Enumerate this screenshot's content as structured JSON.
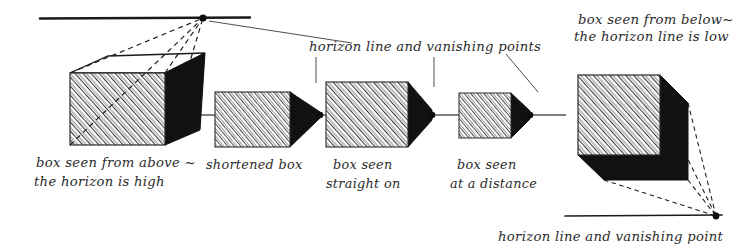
{
  "figure": {
    "background_color": "#ffffff",
    "ink_color": "#1a1a1a"
  },
  "annotations": {
    "top_center": {
      "text": "horizon line and vanishing points",
      "x": 310,
      "y": 48
    },
    "top_right": {
      "line1": "box seen from below~",
      "line2": "the horizon line is low",
      "x": 578,
      "y": 20
    },
    "bottom_right": {
      "text": "horizon line and vanishing point",
      "x": 498,
      "y": 238
    }
  },
  "captions": [
    {
      "id": "caption-box-above",
      "line1": "box seen from above ~",
      "line2": "the horizon is high",
      "x": 36,
      "y": 163
    },
    {
      "id": "caption-shortened-box",
      "line1": "shortened box",
      "line2": "",
      "x": 206,
      "y": 165
    },
    {
      "id": "caption-box-straight-on",
      "line1": "box seen",
      "line2": "straight on",
      "x": 330,
      "y": 165
    },
    {
      "id": "caption-box-at-distance",
      "line1": "box seen",
      "line2": "at a distance",
      "x": 452,
      "y": 165
    }
  ],
  "horizon_lines": [
    {
      "id": "horizon-top",
      "x1": 40,
      "y1": 18,
      "x2": 250,
      "y2": 18,
      "label": "high horizon"
    },
    {
      "id": "horizon-middle",
      "x1": 186,
      "y1": 115,
      "x2": 566,
      "y2": 115,
      "label": "eye-level horizon"
    },
    {
      "id": "horizon-bottom",
      "x1": 565,
      "y1": 216,
      "x2": 722,
      "y2": 216,
      "label": "low horizon"
    }
  ],
  "vanishing_points": [
    {
      "id": "vp-top",
      "x": 203,
      "y": 18
    },
    {
      "id": "vp-box-2",
      "x": 320,
      "y": 115
    },
    {
      "id": "vp-box-3",
      "x": 432,
      "y": 115
    },
    {
      "id": "vp-box-4",
      "x": 530,
      "y": 115
    },
    {
      "id": "vp-bottom",
      "x": 716,
      "y": 216
    }
  ],
  "boxes": [
    {
      "id": "box-seen-from-above",
      "caption_ref": "caption-box-above",
      "front": {
        "x": 70,
        "y": 73,
        "w": 95,
        "h": 72
      },
      "visible_faces": [
        "top-white",
        "front-hatched",
        "right-black"
      ],
      "vanishing_point": "vp-top"
    },
    {
      "id": "box-shortened",
      "caption_ref": "caption-shortened-box",
      "front": {
        "x": 215,
        "y": 92,
        "w": 75,
        "h": 55
      },
      "visible_faces": [
        "front-hatched",
        "right-black"
      ],
      "vanishing_point": "vp-box-2"
    },
    {
      "id": "box-straight-on",
      "caption_ref": "caption-box-straight-on",
      "front": {
        "x": 326,
        "y": 82,
        "w": 82,
        "h": 65
      },
      "visible_faces": [
        "front-hatched",
        "right-black"
      ],
      "vanishing_point": "vp-box-3"
    },
    {
      "id": "box-at-distance",
      "caption_ref": "caption-box-at-distance",
      "front": {
        "x": 459,
        "y": 93,
        "w": 52,
        "h": 45
      },
      "visible_faces": [
        "front-hatched",
        "right-black"
      ],
      "vanishing_point": "vp-box-4"
    },
    {
      "id": "box-seen-from-below",
      "caption_ref": "annotations.top_right",
      "front": {
        "x": 578,
        "y": 75,
        "w": 82,
        "h": 80
      },
      "visible_faces": [
        "front-hatched",
        "right-black",
        "bottom-black"
      ],
      "vanishing_point": "vp-bottom"
    }
  ],
  "leader_lines": [
    {
      "id": "leader-vp-top",
      "from": [
        210,
        22
      ],
      "to": [
        355,
        42
      ]
    },
    {
      "id": "leader-caption-vp-2",
      "from": [
        316,
        56
      ],
      "to": [
        316,
        82
      ]
    },
    {
      "id": "leader-caption-vp-3",
      "from": [
        434,
        56
      ],
      "to": [
        434,
        86
      ]
    },
    {
      "id": "leader-caption-vp-4",
      "from": [
        508,
        54
      ],
      "to": [
        540,
        88
      ]
    }
  ]
}
